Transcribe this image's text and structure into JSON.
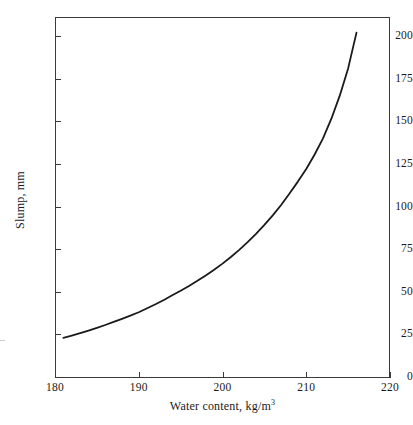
{
  "chart_data": {
    "type": "line",
    "title": "",
    "xlabel": "Water content, kg/m3",
    "xlabel_text": "Water content, kg/m",
    "xlabel_sup": "3",
    "ylabel": "Slump, mm",
    "xlim": [
      180,
      220
    ],
    "ylim": [
      0,
      212
    ],
    "grid": false,
    "legend": null,
    "line_color": "#1a1a1a",
    "xticks": [
      180,
      190,
      200,
      210,
      220
    ],
    "yticks": [
      0,
      25,
      50,
      75,
      100,
      125,
      150,
      175,
      200
    ],
    "xtick_labels": [
      "180",
      "190",
      "200",
      "210",
      "220"
    ],
    "ytick_labels": [
      "0",
      "25",
      "50",
      "75",
      "100",
      "125",
      "150",
      "175",
      "200"
    ],
    "series": [
      {
        "name": "Slump vs water content",
        "x": [
          181.0,
          182.0,
          183.0,
          184.0,
          185.0,
          186.0,
          187.0,
          188.0,
          189.0,
          190.0,
          191.0,
          192.0,
          193.0,
          194.0,
          195.0,
          196.0,
          197.0,
          198.0,
          199.0,
          200.0,
          201.0,
          202.0,
          203.0,
          204.0,
          205.0,
          206.0,
          207.0,
          208.0,
          209.0,
          210.0,
          211.0,
          212.0,
          213.0,
          214.0,
          215.0,
          216.0
        ],
        "y": [
          23.0,
          24.3,
          25.7,
          27.2,
          28.8,
          30.5,
          32.3,
          34.1,
          36.0,
          38.0,
          40.3,
          42.7,
          45.2,
          47.9,
          50.6,
          53.4,
          56.4,
          59.6,
          62.9,
          66.5,
          70.4,
          74.6,
          79.1,
          84.0,
          89.2,
          94.8,
          100.9,
          107.6,
          114.6,
          122.0,
          130.5,
          140.0,
          151.5,
          165.0,
          181.0,
          202.0
        ]
      }
    ]
  }
}
